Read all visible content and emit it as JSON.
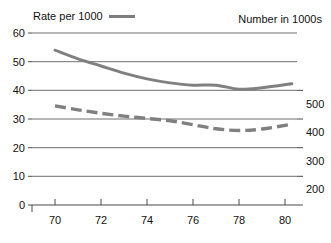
{
  "legend": {
    "left_label": "Rate per 1000",
    "right_label": "Number in 1000s",
    "left_swatch": "solid-line-swatch",
    "right_swatch": "dashed-line-swatch"
  },
  "colors": {
    "line": "#808080",
    "grid": "#6f6f6f",
    "axis": "#4a4a4a",
    "text": "#111111",
    "background": "#ffffff"
  },
  "chart_data": {
    "type": "line",
    "title": "",
    "subtitle": "",
    "xlabel": "",
    "ylabel": "Rate per 1000",
    "y2label": "Number in 1000s",
    "xlim": [
      69,
      80.5
    ],
    "ylim": [
      0,
      60
    ],
    "y2lim": [
      0,
      600
    ],
    "grid": true,
    "legend_position": "top",
    "x_ticks": [
      70,
      72,
      74,
      76,
      78,
      80
    ],
    "x_tick_labels": [
      "70",
      "72",
      "74",
      "76",
      "78",
      "80"
    ],
    "y_ticks": [
      0,
      10,
      20,
      30,
      40,
      50,
      60
    ],
    "y_tick_labels": [
      "0",
      "10",
      "20",
      "30",
      "40",
      "50",
      "60"
    ],
    "y2_ticks": [
      200,
      300,
      400,
      500
    ],
    "y2_tick_labels": [
      "200",
      "300",
      "400",
      "500"
    ],
    "x": [
      70,
      71,
      72,
      73,
      74,
      75,
      76,
      77,
      78,
      79,
      80.3
    ],
    "series": [
      {
        "name": "Rate per 1000",
        "style": "solid",
        "axis": "left",
        "values": [
          54.0,
          51.0,
          48.5,
          46.0,
          44.0,
          42.6,
          41.8,
          41.8,
          40.4,
          40.9,
          42.3
        ]
      },
      {
        "name": "Number in 1000s",
        "style": "dashed",
        "axis": "left",
        "values": [
          34.6,
          33.2,
          32.0,
          31.0,
          30.2,
          29.4,
          28.0,
          26.6,
          26.0,
          26.5,
          28.2
        ]
      }
    ]
  }
}
